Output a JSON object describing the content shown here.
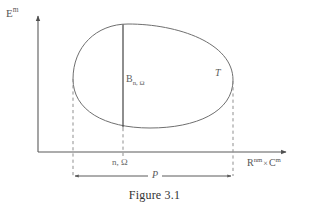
{
  "figure": {
    "caption": "Figure 3.1",
    "axes": {
      "y_label_base": "E",
      "y_label_exp": "m",
      "x_label_base1": "R",
      "x_label_exp1": "nm",
      "x_label_times": "×",
      "x_label_base2": "C",
      "x_label_exp2": "m",
      "x_tick_label": "n, Ω"
    },
    "annotations": {
      "set_label": "T",
      "chord_label_base": "B",
      "chord_label_sub": "n, Ω",
      "measure_label": "P"
    },
    "colors": {
      "background": "#ffffff",
      "axis_line": "#5a5a5a",
      "curve_line": "#6a6a6a",
      "dashed_line": "#8c8c8c",
      "text": "#565656",
      "caption_text": "#333333"
    },
    "geometry": {
      "origin_x": 38,
      "origin_y": 152,
      "y_axis_top": 14,
      "x_axis_right": 288,
      "oval_left_x": 73,
      "oval_right_x": 233,
      "oval_top_y": 24,
      "oval_bottom_y": 128,
      "chord_x": 123,
      "measure_arrow_y": 176
    }
  }
}
